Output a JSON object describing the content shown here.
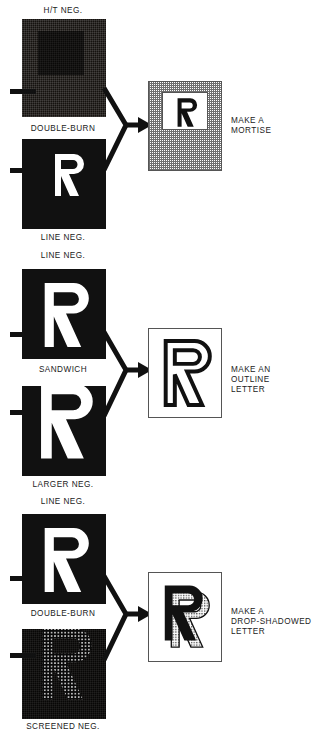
{
  "figure": {
    "letterform": "R",
    "colors": {
      "ink_black": "#111111",
      "paper_white": "#ffffff",
      "halftone_gray": "#6f6f6f",
      "rule_gray": "#555555",
      "text": "#222222"
    }
  },
  "stages": [
    {
      "id": "mortise",
      "operation_label": "DOUBLE-BURN",
      "result_label_lines": [
        "MAKE A",
        "MORTISE"
      ],
      "inputs": [
        {
          "id": "ht-neg",
          "label": "H/T NEG.",
          "label_position": "above",
          "fill": "halftone-dark",
          "glyph": "none"
        },
        {
          "id": "line-neg-1",
          "label": "LINE NEG.",
          "label_position": "below",
          "fill": "solid-black",
          "glyph": "R-reverse-small"
        }
      ],
      "result": {
        "id": "mortise-result",
        "fill": "halftone-gray",
        "glyph": "R-black-in-window"
      }
    },
    {
      "id": "outline",
      "operation_label": "SANDWICH",
      "result_label_lines": [
        "MAKE AN",
        "OUTLINE",
        "LETTER"
      ],
      "inputs": [
        {
          "id": "line-neg-2",
          "label": "LINE NEG.",
          "label_position": "above",
          "fill": "solid-black",
          "glyph": "R-reverse-large"
        },
        {
          "id": "larger-neg",
          "label": "LARGER NEG.",
          "label_position": "below",
          "fill": "solid-black",
          "glyph": "R-reverse-larger"
        }
      ],
      "result": {
        "id": "outline-result",
        "fill": "white",
        "glyph": "R-outline"
      }
    },
    {
      "id": "dropshadow",
      "operation_label": "DOUBLE-BURN",
      "result_label_lines": [
        "MAKE A",
        "DROP-SHADOWED",
        "LETTER"
      ],
      "inputs": [
        {
          "id": "line-neg-3",
          "label": "LINE NEG.",
          "label_position": "above",
          "fill": "solid-black",
          "glyph": "R-reverse-large"
        },
        {
          "id": "screened-neg",
          "label": "SCREENED NEG.",
          "label_position": "below",
          "fill": "halftone-darker",
          "glyph": "R-screened"
        }
      ],
      "result": {
        "id": "dropshadow-result",
        "fill": "white",
        "glyph": "R-black-with-halftone-shadow"
      }
    }
  ],
  "labels": {
    "ht_neg": "H/T NEG.",
    "double_burn_1": "DOUBLE-BURN",
    "line_neg_1": "LINE NEG.",
    "line_neg_2": "LINE NEG.",
    "sandwich": "SANDWICH",
    "larger_neg": "LARGER NEG.",
    "line_neg_3": "LINE NEG.",
    "double_burn_2": "DOUBLE-BURN",
    "screened_neg": "SCREENED NEG.",
    "make_a": "MAKE A",
    "mortise": "MORTISE",
    "make_an": "MAKE AN",
    "outline": "OUTLINE",
    "letter_1": "LETTER",
    "make_a_2": "MAKE A",
    "drop_shadowed": "DROP-SHADOWED",
    "letter_2": "LETTER"
  }
}
